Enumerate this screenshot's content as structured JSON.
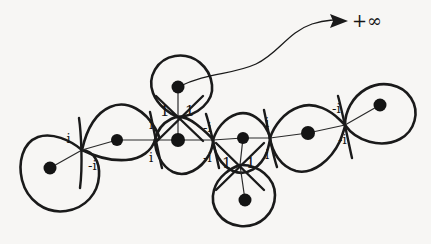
{
  "figure": {
    "background_color": "#f7f6f4",
    "stroke_color": "#1a1a1a",
    "vertex_color": "#141414",
    "infinity_label": "+∞",
    "infinity_arrow": "arrow-to-infinity",
    "crossing_labels": [
      {
        "id": "c1-upper",
        "text": "-i",
        "x": 62,
        "y": 132
      },
      {
        "id": "c1-lower",
        "text": "-i",
        "x": 88,
        "y": 159
      },
      {
        "id": "c2-upper",
        "text": "i",
        "x": 149,
        "y": 118
      },
      {
        "id": "c2-lower",
        "text": "i",
        "x": 149,
        "y": 151
      },
      {
        "id": "c3-left",
        "text": "1",
        "x": 160,
        "y": 104
      },
      {
        "id": "c3-right",
        "text": "1",
        "x": 185,
        "y": 104
      },
      {
        "id": "c4-upper",
        "text": "-i",
        "x": 203,
        "y": 121
      },
      {
        "id": "c4-lower",
        "text": "-i",
        "x": 203,
        "y": 151
      },
      {
        "id": "c5-left",
        "text": "1",
        "x": 222,
        "y": 156
      },
      {
        "id": "c5-right",
        "text": "1",
        "x": 246,
        "y": 156
      },
      {
        "id": "c6-upper",
        "text": "i",
        "x": 265,
        "y": 116
      },
      {
        "id": "c6-lower",
        "text": "i",
        "x": 265,
        "y": 148
      },
      {
        "id": "c7-upper",
        "text": "-i",
        "x": 332,
        "y": 102
      },
      {
        "id": "c7-lower",
        "text": "-i",
        "x": 338,
        "y": 133
      }
    ],
    "vertices": [
      {
        "id": "v-left-loop",
        "x": 50,
        "y": 168,
        "r": 6.5
      },
      {
        "id": "v-a",
        "x": 117,
        "y": 140,
        "r": 6.0
      },
      {
        "id": "v-b",
        "x": 178,
        "y": 140,
        "r": 7.0
      },
      {
        "id": "v-top-loop",
        "x": 178,
        "y": 87,
        "r": 6.5
      },
      {
        "id": "v-c",
        "x": 243,
        "y": 138,
        "r": 6.0
      },
      {
        "id": "v-bottom-loop",
        "x": 245,
        "y": 200,
        "r": 6.5
      },
      {
        "id": "v-d",
        "x": 308,
        "y": 133,
        "r": 7.0
      },
      {
        "id": "v-right-loop",
        "x": 380,
        "y": 105,
        "r": 6.5
      }
    ],
    "crossings": [
      {
        "id": "x1",
        "x": 82,
        "y": 150
      },
      {
        "id": "x2",
        "x": 155,
        "y": 140
      },
      {
        "id": "x3",
        "x": 178,
        "y": 117
      },
      {
        "id": "x4",
        "x": 213,
        "y": 140
      },
      {
        "id": "x5",
        "x": 240,
        "y": 165
      },
      {
        "id": "x6",
        "x": 270,
        "y": 138
      },
      {
        "id": "x7",
        "x": 345,
        "y": 125
      }
    ]
  }
}
